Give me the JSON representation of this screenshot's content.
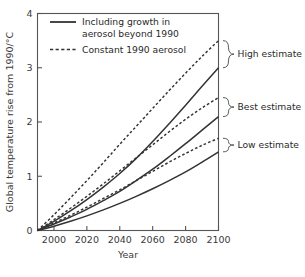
{
  "chart_data": {
    "type": "line",
    "title": "",
    "xlabel": "Year",
    "ylabel": "Global temperature rise from 1990/°C",
    "xlim": [
      1990,
      2100
    ],
    "ylim": [
      0,
      4
    ],
    "grid": false,
    "legend_position": "top-left",
    "xticks": [
      2000,
      2020,
      2040,
      2060,
      2080,
      2100
    ],
    "xtick_labels": [
      "2000",
      "2020",
      "2040",
      "2060",
      "2080",
      "2100"
    ],
    "yticks": [
      0,
      1,
      2,
      3,
      4
    ],
    "ytick_labels": [
      "0",
      "1",
      "2",
      "3",
      "4"
    ],
    "x": [
      1990,
      2000,
      2010,
      2020,
      2030,
      2040,
      2050,
      2060,
      2070,
      2080,
      2090,
      2100
    ],
    "series": [
      {
        "name": "High estimate — constant 1990 aerosol",
        "style": "dashed",
        "estimate": "High estimate",
        "values": [
          0,
          0.29,
          0.6,
          0.92,
          1.25,
          1.59,
          1.92,
          2.25,
          2.58,
          2.9,
          3.21,
          3.5
        ]
      },
      {
        "name": "High estimate — including growth in aerosol beyond 1990",
        "style": "solid",
        "estimate": "High estimate",
        "values": [
          0,
          0.17,
          0.36,
          0.57,
          0.8,
          1.05,
          1.33,
          1.64,
          1.97,
          2.31,
          2.66,
          3.0
        ]
      },
      {
        "name": "Best estimate — constant 1990 aerosol",
        "style": "dashed",
        "estimate": "Best estimate",
        "values": [
          0,
          0.2,
          0.41,
          0.63,
          0.86,
          1.1,
          1.34,
          1.58,
          1.82,
          2.05,
          2.26,
          2.45
        ]
      },
      {
        "name": "Best estimate — including growth in aerosol beyond 1990",
        "style": "solid",
        "estimate": "Best estimate",
        "values": [
          0,
          0.12,
          0.25,
          0.39,
          0.55,
          0.72,
          0.92,
          1.13,
          1.36,
          1.6,
          1.85,
          2.1
        ]
      },
      {
        "name": "Low estimate — constant 1990 aerosol",
        "style": "dashed",
        "estimate": "Low estimate",
        "values": [
          0,
          0.14,
          0.28,
          0.43,
          0.59,
          0.75,
          0.92,
          1.09,
          1.26,
          1.42,
          1.57,
          1.7
        ]
      },
      {
        "name": "Low estimate — including growth in aerosol beyond 1990",
        "style": "solid",
        "estimate": "Low estimate",
        "values": [
          0,
          0.08,
          0.17,
          0.27,
          0.38,
          0.5,
          0.63,
          0.77,
          0.92,
          1.08,
          1.26,
          1.45
        ]
      }
    ],
    "legend": [
      {
        "label_line1": "Including growth in",
        "label_line2": "aerosol beyond 1990",
        "style": "solid"
      },
      {
        "label_line1": "Constant 1990 aerosol",
        "label_line2": "",
        "style": "dashed"
      }
    ],
    "annotations": [
      {
        "label": "High estimate",
        "from": 3.0,
        "to": 3.5
      },
      {
        "label": "Best estimate",
        "from": 2.1,
        "to": 2.45
      },
      {
        "label": "Low estimate",
        "from": 1.45,
        "to": 1.7
      }
    ],
    "colors": {
      "line": "#333333",
      "axis": "#555555",
      "background": "#ffffff"
    }
  }
}
